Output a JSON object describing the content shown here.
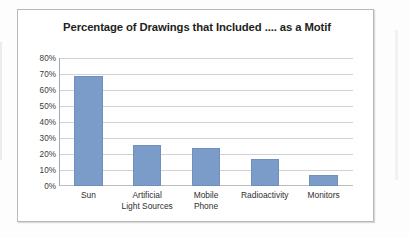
{
  "chart_data": {
    "type": "bar",
    "title": "Percentage of Drawings that Included .... as a Motif",
    "xlabel": "",
    "ylabel": "",
    "categories": [
      "Sun",
      "Artificial\nLight Sources",
      "Mobile\nPhone",
      "Radioactivity",
      "Monitors"
    ],
    "values": [
      69,
      25.5,
      24,
      17,
      7
    ],
    "ylim": [
      0,
      80
    ],
    "ytick_labels": [
      "80%",
      "70%",
      "60%",
      "50%",
      "40%",
      "30%",
      "20%",
      "10%",
      "0%"
    ],
    "ytick_values": [
      80,
      70,
      60,
      50,
      40,
      30,
      20,
      10,
      0
    ],
    "grid": true,
    "legend": false,
    "series": [
      {
        "name": "Percentage of Drawings",
        "values": [
          69,
          25.5,
          24,
          17,
          7
        ]
      }
    ],
    "colors": {
      "bar_fill": "#7b9bc9",
      "gridline": "#d2d2d2",
      "axis": "#a8a8a8",
      "title_text": "#231f20",
      "tick_text": "#3b3b3b",
      "frame_border": "#b9b9b9",
      "background": "#ffffff"
    }
  }
}
